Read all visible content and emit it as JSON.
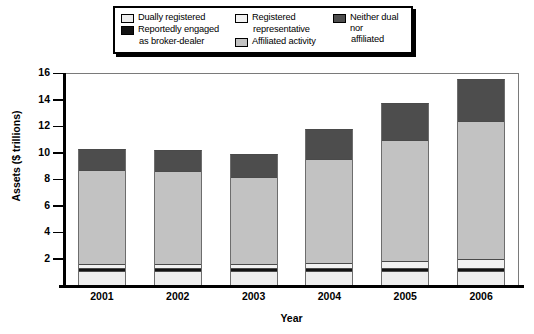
{
  "chart_data": {
    "type": "bar",
    "subtype": "stacked-bar",
    "title": "",
    "xlabel": "Year",
    "ylabel": "Assets ($ trillions)",
    "categories": [
      "2001",
      "2002",
      "2003",
      "2004",
      "2005",
      "2006"
    ],
    "ylim": [
      0,
      16
    ],
    "yticks": [
      2,
      4,
      6,
      8,
      10,
      12,
      14,
      16
    ],
    "ytick_labels": [
      "2",
      "4",
      "6",
      "8",
      "10",
      "12",
      "14",
      "16"
    ],
    "grid": false,
    "legend_position": "top",
    "stack_order_bottom_to_top": [
      "Dually registered",
      "Reportedly engaged as broker-dealer",
      "Registered representative",
      "Affiliated activity",
      "Neither dual nor affiliated"
    ],
    "series": [
      {
        "name": "Dually registered",
        "color": "#ededed",
        "values": [
          1.0,
          1.0,
          1.0,
          1.0,
          1.0,
          1.0
        ]
      },
      {
        "name": "Reportedly engaged as broker-dealer",
        "color": "#121212",
        "values": [
          0.2,
          0.2,
          0.2,
          0.2,
          0.2,
          0.2
        ]
      },
      {
        "name": "Registered representative",
        "color": "#f2f2f2",
        "values": [
          0.3,
          0.3,
          0.3,
          0.4,
          0.5,
          0.7
        ]
      },
      {
        "name": "Affiliated activity",
        "color": "#c2c2c2",
        "values": [
          7.1,
          7.0,
          6.6,
          7.8,
          9.2,
          10.4
        ]
      },
      {
        "name": "Neither dual nor affiliated",
        "color": "#4d4d4d",
        "values": [
          1.6,
          1.6,
          1.7,
          2.3,
          2.8,
          3.2
        ]
      }
    ],
    "totals": [
      10.2,
      10.1,
      9.8,
      11.7,
      13.7,
      15.5
    ]
  },
  "legend": {
    "columns": [
      {
        "entries": [
          {
            "label": "Dually registered",
            "swatch": "#ededed",
            "swatch_name": "legend-swatch-dually-registered"
          },
          {
            "label": "Reportedly engaged",
            "continuation": "as broker-dealer",
            "swatch": "#121212",
            "swatch_name": "legend-swatch-reportedly-engaged"
          }
        ]
      },
      {
        "entries": [
          {
            "label": "Registered",
            "continuation": "representative",
            "swatch": "#f2f2f2",
            "swatch_name": "legend-swatch-registered-representative"
          },
          {
            "label": "Affiliated activity",
            "swatch": "#c2c2c2",
            "swatch_name": "legend-swatch-affiliated-activity"
          }
        ]
      },
      {
        "entries": [
          {
            "label": "Neither dual nor",
            "continuation": "affiliated",
            "swatch": "#4d4d4d",
            "swatch_name": "legend-swatch-neither-dual-nor-affiliated"
          }
        ]
      }
    ]
  },
  "axes": {
    "y": {
      "label": "Assets ($ trillions)",
      "ticks": [
        "16",
        "14",
        "12",
        "10",
        "8",
        "6",
        "4",
        "2"
      ]
    },
    "x": {
      "label": "Year",
      "ticks": [
        "2001",
        "2002",
        "2003",
        "2004",
        "2005",
        "2006"
      ]
    }
  },
  "colors": {
    "dually_registered": "#ededed",
    "reportedly_engaged": "#121212",
    "registered_representative": "#f2f2f2",
    "affiliated_activity": "#c2c2c2",
    "neither_dual_nor_affiliated": "#4d4d4d",
    "axis": "#000000",
    "frame": "#7a7a7a",
    "background": "#ffffff"
  }
}
